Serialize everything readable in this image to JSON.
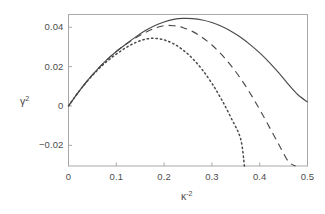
{
  "chart_data": {
    "type": "line",
    "title": "",
    "subtitle": "",
    "xlabel": "k^-2",
    "xlabel_base": "κ",
    "xlabel_exponent": "-2",
    "ylabel": "γ^2",
    "ylabel_base": "γ",
    "ylabel_exponent": "2",
    "xlim": [
      0,
      0.5
    ],
    "ylim": [
      -0.0305,
      0.0465
    ],
    "grid": false,
    "legend": "none",
    "frame": "box",
    "xticks": [
      0,
      0.1,
      0.2,
      0.3,
      0.4,
      0.5
    ],
    "xtick_labels": [
      "0",
      "0.1",
      "0.2",
      "0.3",
      "0.4",
      "0.5"
    ],
    "yticks": [
      -0.02,
      0,
      0.02,
      0.04
    ],
    "ytick_labels": [
      "-0.02",
      "0",
      "0.02",
      "0.04"
    ],
    "series": [
      {
        "name": "solid-curve",
        "style": "solid",
        "color": "#4a4a4a",
        "peak": {
          "x": 0.245,
          "y": 0.0445
        },
        "x": [
          0.0,
          0.02,
          0.04,
          0.06,
          0.08,
          0.1,
          0.12,
          0.14,
          0.16,
          0.18,
          0.2,
          0.22,
          0.24,
          0.26,
          0.28,
          0.3,
          0.32,
          0.34,
          0.36,
          0.38,
          0.4,
          0.42,
          0.44,
          0.46,
          0.48,
          0.5
        ],
        "values": [
          0.0,
          0.0068,
          0.013,
          0.0185,
          0.0234,
          0.0277,
          0.0314,
          0.035,
          0.0382,
          0.0408,
          0.0427,
          0.044,
          0.0445,
          0.0444,
          0.0437,
          0.0424,
          0.0405,
          0.038,
          0.0349,
          0.0312,
          0.027,
          0.0222,
          0.0168,
          0.011,
          0.0057,
          0.002
        ]
      },
      {
        "name": "dashed-curve",
        "style": "dashed",
        "color": "#4a4a4a",
        "peak": {
          "x": 0.205,
          "y": 0.041
        },
        "zero_crossing": {
          "x": 0.395,
          "y": 0.0
        },
        "x": [
          0.0,
          0.02,
          0.04,
          0.06,
          0.08,
          0.1,
          0.12,
          0.14,
          0.16,
          0.18,
          0.2,
          0.22,
          0.24,
          0.26,
          0.28,
          0.3,
          0.32,
          0.34,
          0.36,
          0.38,
          0.4,
          0.42,
          0.44,
          0.46,
          0.475
        ],
        "values": [
          0.0,
          0.0068,
          0.013,
          0.0185,
          0.0234,
          0.0277,
          0.0314,
          0.0346,
          0.0373,
          0.0395,
          0.0408,
          0.0408,
          0.0398,
          0.0378,
          0.0348,
          0.031,
          0.0262,
          0.0205,
          0.014,
          0.0065,
          -0.0018,
          -0.0106,
          -0.0196,
          -0.0282,
          -0.0305
        ]
      },
      {
        "name": "dotted-curve",
        "style": "dotted",
        "color": "#4a4a4a",
        "peak": {
          "x": 0.172,
          "y": 0.0345
        },
        "zero_crossing": {
          "x": 0.295,
          "y": 0.0
        },
        "x": [
          0.0,
          0.02,
          0.04,
          0.06,
          0.08,
          0.1,
          0.12,
          0.14,
          0.16,
          0.18,
          0.2,
          0.22,
          0.24,
          0.26,
          0.28,
          0.3,
          0.32,
          0.34,
          0.36,
          0.368
        ],
        "values": [
          0.0,
          0.0068,
          0.0128,
          0.0181,
          0.0226,
          0.0264,
          0.0296,
          0.0322,
          0.0339,
          0.0344,
          0.0336,
          0.0316,
          0.0284,
          0.024,
          0.0184,
          0.0115,
          0.0034,
          -0.006,
          -0.0166,
          -0.0305
        ]
      }
    ]
  }
}
